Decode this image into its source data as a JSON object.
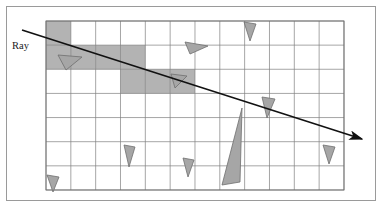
{
  "figure": {
    "canvas": {
      "width": 382,
      "height": 207,
      "background": "#ffffff"
    },
    "outer_frame": {
      "name": "figure-border",
      "x": 6,
      "y": 6,
      "width": 370,
      "height": 195,
      "stroke": "#9a9a9a",
      "stroke_width": 1,
      "fill": "#ffffff"
    },
    "grid": {
      "x": 46,
      "y": 21,
      "width": 298,
      "height": 169,
      "columns": 12,
      "rows": 7,
      "cell_width": 24.83,
      "cell_height": 24.14,
      "line_color": "#808080",
      "line_width": 0.7,
      "border_color": "#707070"
    },
    "shaded_cells": {
      "fill": "#b3b3b3",
      "opacity": 1,
      "cells": [
        {
          "col": 0,
          "row": 0
        },
        {
          "col": 0,
          "row": 1
        },
        {
          "col": 1,
          "row": 1
        },
        {
          "col": 2,
          "row": 1
        },
        {
          "col": 3,
          "row": 1
        },
        {
          "col": 3,
          "row": 2
        },
        {
          "col": 4,
          "row": 2
        },
        {
          "col": 5,
          "row": 2
        }
      ]
    },
    "ray": {
      "label": "Ray",
      "label_x": 12,
      "label_y": 49,
      "start_x": 22,
      "start_y": 30,
      "end_x": 362,
      "end_y": 139,
      "color": "#111111",
      "width": 1.6,
      "arrowhead": "solid-triangle"
    },
    "triangles": {
      "fill": "#a6a6a6",
      "stroke": "#6e6e6e",
      "stroke_width": 0.8,
      "items": [
        {
          "name": "triangle-top-left",
          "points": "58,55 82,57 66,70"
        },
        {
          "name": "triangle-upper-mid",
          "points": "185,42 208,46 190,54"
        },
        {
          "name": "triangle-top-right",
          "points": "244,22 256,24 250,41"
        },
        {
          "name": "triangle-center",
          "points": "171,74 187,76 175,88"
        },
        {
          "name": "triangle-right-upper",
          "points": "262,97 275,99 267,118"
        },
        {
          "name": "triangle-large",
          "points": "242,108 222,185 240,182"
        },
        {
          "name": "triangle-lower-left",
          "points": "124,145 135,147 129,167"
        },
        {
          "name": "triangle-lower-mid",
          "points": "183,158 194,160 188,177"
        },
        {
          "name": "triangle-lower-right",
          "points": "323,145 335,147 329,164"
        },
        {
          "name": "triangle-bottom-left",
          "points": "47,175 59,177 53,192"
        }
      ]
    }
  },
  "chart_data": {
    "type": "scatter",
    "xlabel": "",
    "ylabel": "",
    "grid": true,
    "legend": null,
    "annotations": [
      "Ray"
    ]
  }
}
